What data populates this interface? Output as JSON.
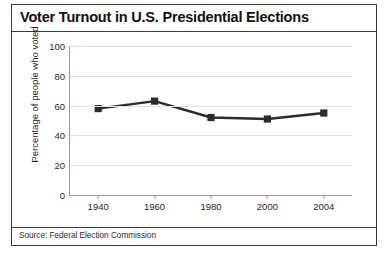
{
  "chart_data": {
    "type": "line",
    "title": "Voter Turnout in U.S. Presidential Elections",
    "xlabel": "",
    "ylabel": "Percentage of people who voted",
    "categories": [
      "1940",
      "1960",
      "1980",
      "2000",
      "2004"
    ],
    "values": [
      58,
      63,
      52,
      51,
      55
    ],
    "series": [
      {
        "name": "Percentage of people who voted",
        "values": [
          58,
          63,
          52,
          51,
          55
        ]
      }
    ],
    "ylim": [
      0,
      100
    ],
    "yticks": [
      0,
      20,
      40,
      60,
      80,
      100
    ],
    "ytick_labels": [
      "0",
      "20",
      "40",
      "60",
      "80",
      "100"
    ],
    "xtick_labels": [
      "1940",
      "1960",
      "1980",
      "2000",
      "2004"
    ],
    "grid": "horizontal",
    "legend": "none",
    "marker": "square",
    "line_color": "#2b2b2b",
    "marker_color": "#2b2b2b",
    "grid_color": "#e2e2e2",
    "axis_color": "#9a9a9a",
    "source": "Source: Federal Election Commission"
  },
  "figure": {
    "title": "Voter Turnout in U.S. Presidential Elections",
    "source": "Source: Federal Election Commission",
    "border_color": "#3a3a3a"
  }
}
